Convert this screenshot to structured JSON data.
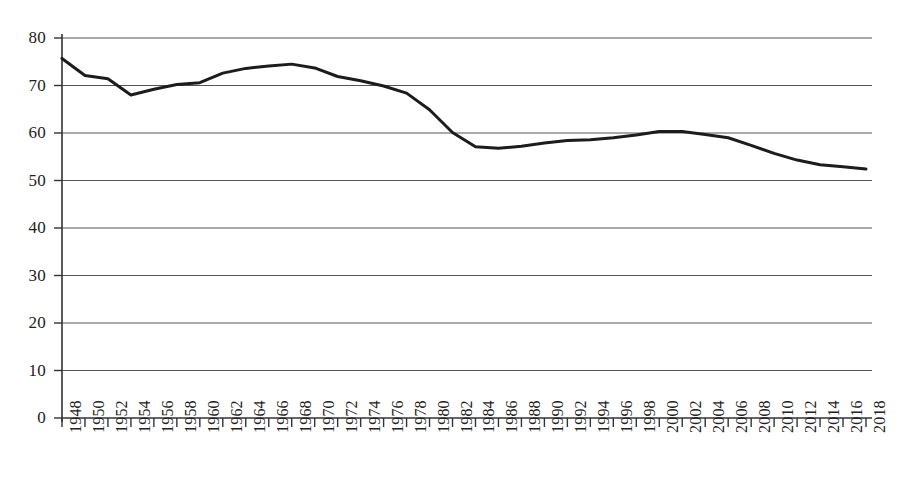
{
  "chart_data": {
    "type": "line",
    "title": "",
    "subtitle": "",
    "xlabel": "",
    "ylabel": "",
    "xlim": [
      1948,
      2018
    ],
    "ylim": [
      0,
      80
    ],
    "ytick_step": 10,
    "xtick_step": 2,
    "grid": true,
    "grid_axis": "y",
    "legend": false,
    "legend_position": "none",
    "line_color": "#1c1c1c",
    "line_width": 3,
    "grid_color": "#555555",
    "axis_color": "#333333",
    "background": "#ffffff",
    "yticks": [
      0,
      10,
      20,
      30,
      40,
      50,
      60,
      70,
      80
    ],
    "ytick_labels": [
      "0",
      "10",
      "20",
      "30",
      "40",
      "50",
      "60",
      "70",
      "80"
    ],
    "categories": [
      "1948",
      "1950",
      "1952",
      "1954",
      "1956",
      "1958",
      "1960",
      "1962",
      "1964",
      "1966",
      "1968",
      "1970",
      "1972",
      "1974",
      "1976",
      "1978",
      "1980",
      "1982",
      "1984",
      "1986",
      "1988",
      "1990",
      "1992",
      "1994",
      "1996",
      "1998",
      "2000",
      "2002",
      "2004",
      "2006",
      "2008",
      "2010",
      "2012",
      "2014",
      "2016",
      "2018"
    ],
    "x": [
      1948,
      1950,
      1952,
      1954,
      1956,
      1958,
      1960,
      1962,
      1964,
      1966,
      1968,
      1970,
      1972,
      1974,
      1976,
      1978,
      1980,
      1982,
      1984,
      1986,
      1988,
      1990,
      1992,
      1994,
      1996,
      1998,
      2000,
      2002,
      2004,
      2006,
      2008,
      2010,
      2012,
      2014,
      2016,
      2018
    ],
    "values": [
      75.7,
      72.1,
      71.4,
      68.0,
      69.2,
      70.2,
      70.6,
      72.6,
      73.6,
      74.1,
      74.5,
      73.7,
      71.9,
      71.0,
      69.9,
      68.4,
      64.9,
      60.1,
      57.1,
      56.8,
      57.2,
      57.9,
      58.4,
      58.6,
      59.0,
      59.6,
      60.3,
      60.3,
      59.7,
      59.0,
      57.4,
      55.7,
      54.3,
      53.3,
      52.9,
      52.4
    ],
    "series": [
      {
        "name": "series-1",
        "values": [
          75.7,
          72.1,
          71.4,
          68.0,
          69.2,
          70.2,
          70.6,
          72.6,
          73.6,
          74.1,
          74.5,
          73.7,
          71.9,
          71.0,
          69.9,
          68.4,
          64.9,
          60.1,
          57.1,
          56.8,
          57.2,
          57.9,
          58.4,
          58.6,
          59.0,
          59.6,
          60.3,
          60.3,
          59.7,
          59.0,
          57.4,
          55.7,
          54.3,
          53.3,
          52.9,
          52.4
        ]
      }
    ]
  }
}
